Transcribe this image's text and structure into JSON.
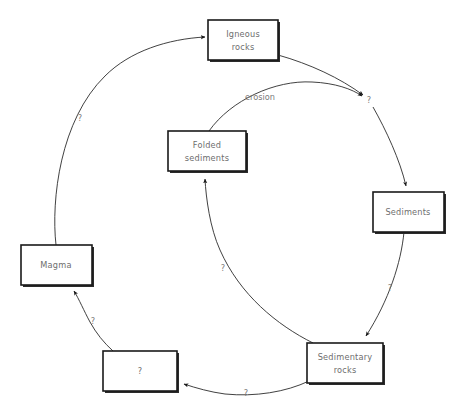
{
  "diagram": {
    "title": "",
    "background_color": "#ffffff",
    "box_stroke_color": "#1a1a1a",
    "box_fill_color": "#ffffff",
    "label_color": "#6e6e6e",
    "edge_color": "#2b2b2b",
    "nodes": [
      {
        "id": "igneous",
        "label_line1": "Igneous",
        "label_line2": "rocks"
      },
      {
        "id": "sediments",
        "label_line1": "Sediments",
        "label_line2": ""
      },
      {
        "id": "sedimentary",
        "label_line1": "Sedimentary",
        "label_line2": "rocks"
      },
      {
        "id": "unknown",
        "label_line1": "?",
        "label_line2": ""
      },
      {
        "id": "magma",
        "label_line1": "Magma",
        "label_line2": ""
      },
      {
        "id": "folded",
        "label_line1": "Folded",
        "label_line2": "sediments"
      }
    ],
    "edges": [
      {
        "id": "magma-to-igneous",
        "from": "magma",
        "to": "igneous",
        "label": "?"
      },
      {
        "id": "igneous-to-weathering",
        "from": "igneous",
        "to": "weathering",
        "label": "?"
      },
      {
        "id": "folded-to-weathering",
        "from": "folded",
        "to": "weathering",
        "label": "erosion"
      },
      {
        "id": "weathering-to-sediments",
        "from": "weathering",
        "to": "sediments",
        "label": ""
      },
      {
        "id": "sediments-to-sedimentary",
        "from": "sediments",
        "to": "sedimentary",
        "label": "?"
      },
      {
        "id": "sedimentary-to-folded",
        "from": "sedimentary",
        "to": "folded",
        "label": "?"
      },
      {
        "id": "sedimentary-to-unknown",
        "from": "sedimentary",
        "to": "unknown",
        "label": "?"
      },
      {
        "id": "unknown-to-magma",
        "from": "unknown",
        "to": "magma",
        "label": "?"
      }
    ]
  }
}
